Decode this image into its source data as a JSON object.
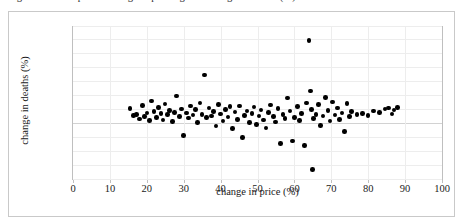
{
  "caption": {
    "text": "Figure 3. Scatterplot of change in price against change in deaths (%)"
  },
  "chart_data": {
    "type": "scatter",
    "title": "",
    "xlabel": "change in price (%)",
    "ylabel": "change in deaths (%)",
    "xlim": [
      0,
      100
    ],
    "ylim": [
      -20,
      35
    ],
    "xticks": [
      0,
      10,
      20,
      30,
      40,
      50,
      60,
      70,
      80,
      90,
      100
    ],
    "xtick_labels": [
      "0",
      "10",
      "20",
      "30",
      "40",
      "50",
      "60",
      "70",
      "80",
      "90",
      "100"
    ],
    "yticks": [
      35,
      30,
      25,
      20,
      15,
      10,
      5,
      0,
      -5,
      -10,
      -15,
      -20
    ],
    "ytick_labels": [
      "35.00",
      "30.00",
      "25.00",
      "20.00",
      "15.00",
      "10.00",
      "5.00",
      "0.00",
      "−5.00",
      "−10.00",
      "−15.00",
      "−20.00"
    ],
    "grid": "horizontal-and-vertical-light",
    "legend": null,
    "marker": {
      "shape": "circle",
      "color": "#000000",
      "size": 4.6
    },
    "n_points": 106,
    "series": [
      {
        "name": "countries",
        "points": [
          [
            15.5,
            5.2
          ],
          [
            16.4,
            2.6
          ],
          [
            17.2,
            3.1
          ],
          [
            18.0,
            1.4
          ],
          [
            18.9,
            6.3
          ],
          [
            19.4,
            2.2
          ],
          [
            20.1,
            3.5
          ],
          [
            20.8,
            0.9
          ],
          [
            21.3,
            7.8
          ],
          [
            21.9,
            4.1
          ],
          [
            22.6,
            2.0
          ],
          [
            23.1,
            5.6
          ],
          [
            23.8,
            3.3
          ],
          [
            24.4,
            1.1
          ],
          [
            24.9,
            6.8
          ],
          [
            25.6,
            2.9
          ],
          [
            26.2,
            4.4
          ],
          [
            26.9,
            0.4
          ],
          [
            27.5,
            3.8
          ],
          [
            28.1,
            9.7
          ],
          [
            28.8,
            2.3
          ],
          [
            29.4,
            5.0
          ],
          [
            30.0,
            -4.6
          ],
          [
            30.7,
            3.6
          ],
          [
            31.3,
            1.7
          ],
          [
            31.9,
            6.1
          ],
          [
            32.5,
            2.8
          ],
          [
            33.2,
            4.9
          ],
          [
            33.8,
            0.2
          ],
          [
            34.4,
            7.2
          ],
          [
            35.0,
            3.0
          ],
          [
            35.6,
            17.2
          ],
          [
            36.2,
            1.9
          ],
          [
            36.9,
            5.4
          ],
          [
            37.5,
            2.4
          ],
          [
            38.1,
            4.0
          ],
          [
            38.8,
            -1.2
          ],
          [
            39.4,
            6.5
          ],
          [
            40.0,
            3.2
          ],
          [
            40.7,
            0.7
          ],
          [
            41.3,
            4.7
          ],
          [
            42.0,
            2.1
          ],
          [
            42.6,
            5.9
          ],
          [
            43.3,
            -2.0
          ],
          [
            43.9,
            3.9
          ],
          [
            44.6,
            1.3
          ],
          [
            45.2,
            6.0
          ],
          [
            45.9,
            -5.3
          ],
          [
            46.5,
            2.7
          ],
          [
            47.2,
            4.3
          ],
          [
            47.8,
            0.1
          ],
          [
            48.5,
            3.4
          ],
          [
            49.1,
            5.7
          ],
          [
            49.8,
            -0.6
          ],
          [
            50.4,
            2.5
          ],
          [
            51.0,
            4.6
          ],
          [
            51.7,
            1.0
          ],
          [
            52.3,
            -1.8
          ],
          [
            53.0,
            3.7
          ],
          [
            53.6,
            6.4
          ],
          [
            54.3,
            2.2
          ],
          [
            54.9,
            0.3
          ],
          [
            55.6,
            5.1
          ],
          [
            56.2,
            -7.4
          ],
          [
            56.9,
            3.1
          ],
          [
            57.5,
            1.6
          ],
          [
            58.2,
            8.9
          ],
          [
            58.8,
            4.2
          ],
          [
            59.5,
            -6.5
          ],
          [
            60.1,
            2.0
          ],
          [
            60.8,
            5.8
          ],
          [
            61.4,
            0.8
          ],
          [
            62.0,
            3.3
          ],
          [
            62.7,
            -8.2
          ],
          [
            63.3,
            7.1
          ],
          [
            64.0,
            29.6
          ],
          [
            64.3,
            11.4
          ],
          [
            64.6,
            4.8
          ],
          [
            64.9,
            -16.8
          ],
          [
            65.2,
            1.5
          ],
          [
            65.8,
            3.0
          ],
          [
            66.5,
            6.6
          ],
          [
            67.1,
            -1.0
          ],
          [
            67.8,
            2.4
          ],
          [
            68.4,
            9.2
          ],
          [
            69.1,
            4.5
          ],
          [
            69.7,
            0.6
          ],
          [
            70.4,
            7.5
          ],
          [
            71.0,
            2.8
          ],
          [
            71.6,
            5.3
          ],
          [
            72.3,
            1.2
          ],
          [
            72.9,
            3.6
          ],
          [
            73.6,
            -3.1
          ],
          [
            74.2,
            6.9
          ],
          [
            74.9,
            2.3
          ],
          [
            75.5,
            4.1
          ],
          [
            77.0,
            2.9
          ],
          [
            78.5,
            3.4
          ],
          [
            80.0,
            2.6
          ],
          [
            81.5,
            4.2
          ],
          [
            83.0,
            3.8
          ],
          [
            84.5,
            5.0
          ],
          [
            85.5,
            5.4
          ],
          [
            86.5,
            3.2
          ],
          [
            87.0,
            4.6
          ],
          [
            88.0,
            5.5
          ]
        ]
      }
    ]
  }
}
